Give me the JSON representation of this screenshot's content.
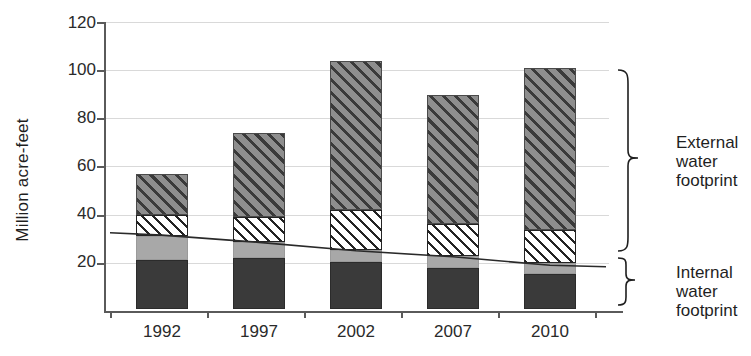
{
  "chart_data": {
    "type": "bar",
    "subtype": "stacked-bar-with-line",
    "title": "",
    "xlabel": "",
    "ylabel": "Million acre-feet",
    "ylim": [
      0,
      120
    ],
    "yticks": [
      0,
      20,
      40,
      60,
      80,
      100,
      120
    ],
    "ytick_labels": [
      "",
      "20",
      "40",
      "60",
      "80",
      "100",
      "120"
    ],
    "grid": true,
    "legend_position": "right-braces",
    "categories": [
      "1992",
      "1997",
      "2002",
      "2007",
      "2010"
    ],
    "series": [
      {
        "name": "Internal water footprint - dark solid",
        "pattern": "solid-dark",
        "values": [
          20.5,
          21.0,
          19.5,
          17.0,
          14.5
        ]
      },
      {
        "name": "Internal water footprint - light solid",
        "pattern": "solid-light",
        "values": [
          10.0,
          7.0,
          5.0,
          5.0,
          4.5
        ]
      },
      {
        "name": "External water footprint - white hatch",
        "pattern": "hatch-white",
        "values": [
          8.5,
          10.0,
          16.5,
          13.5,
          14.0
        ]
      },
      {
        "name": "External water footprint - dark hatch",
        "pattern": "hatch-dark",
        "values": [
          17.0,
          35.0,
          62.0,
          53.5,
          67.0
        ]
      }
    ],
    "totals": [
      56,
      73,
      103,
      89,
      100
    ],
    "segment_tops": {
      "1992": [
        20.5,
        30.5,
        39.0,
        56.0
      ],
      "1997": [
        21.0,
        28.0,
        38.0,
        73.0
      ],
      "2002": [
        19.5,
        24.5,
        41.0,
        103.0
      ],
      "2007": [
        17.0,
        22.0,
        35.5,
        89.0
      ],
      "2010": [
        14.5,
        19.0,
        33.0,
        100.0
      ]
    },
    "trend_line": {
      "name": "Internal water footprint total",
      "x": [
        "1992",
        "1997",
        "2002",
        "2007",
        "2010"
      ],
      "values": [
        31.5,
        28.5,
        25.0,
        22.5,
        19.0
      ]
    },
    "annotations": [
      {
        "id": "external",
        "text": "External water footprint",
        "lines": [
          "External",
          "water",
          "footprint"
        ],
        "spans_from": 33.0,
        "spans_to": 103.0
      },
      {
        "id": "internal",
        "text": "Internal water footprint",
        "lines": [
          "Internal",
          "water",
          "footprint"
        ],
        "spans_from": 0.0,
        "spans_to": 33.0
      }
    ]
  },
  "axis": {
    "y_title": "Million acre-feet",
    "y_ticks": [
      "120",
      "100",
      "80",
      "60",
      "40",
      "20"
    ],
    "x_ticks": [
      "1992",
      "1997",
      "2002",
      "2007",
      "2010"
    ]
  },
  "annotations": {
    "external": {
      "line1": "External",
      "line2": "water",
      "line3": "footprint"
    },
    "internal": {
      "line1": "Internal",
      "line2": "water",
      "line3": "footprint"
    }
  },
  "colors": {
    "dark_solid": "#3a3a3a",
    "light_solid": "#a8a8a8",
    "white_hatch_bg": "#ffffff",
    "dark_hatch_bg": "#6e6e6e",
    "axis": "#5a5a5a",
    "grid": "#d9d9d9",
    "text": "#1f1f1f"
  }
}
